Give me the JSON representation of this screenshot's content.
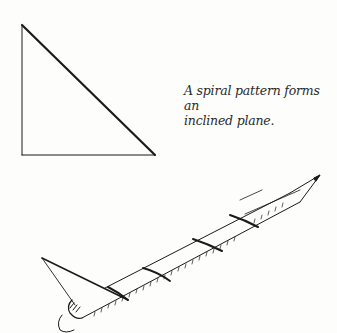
{
  "figure": {
    "caption": "A spiral pattern forms an inclined plane.",
    "caption_line1": "A spiral pattern forms an",
    "caption_line2": "inclined plane.",
    "illustrations": [
      {
        "name": "right-triangle",
        "description": "Paper triangle with hypotenuse representing an inclined plane"
      },
      {
        "name": "pencil-wrapped",
        "description": "Pencil with paper triangle wrapped around it forming a spiral"
      }
    ],
    "ink_color": "#1a1a1a"
  }
}
